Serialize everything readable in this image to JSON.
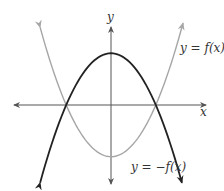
{
  "chart_data": {
    "type": "line",
    "title": "",
    "xlabel": "x",
    "ylabel": "y",
    "grid": false,
    "axis_ticks": "none",
    "series": [
      {
        "name": "y = f(x)",
        "color": "#a6a6a6",
        "shape": "upward parabola",
        "roots": [
          -2,
          2
        ],
        "vertex": [
          0,
          -2.3
        ],
        "equation_approx": "f(x) ≈ 0.58x^2 - 2.3"
      },
      {
        "name": "y = -f(x)",
        "color": "#222222",
        "shape": "downward parabola",
        "roots": [
          -2,
          2
        ],
        "vertex": [
          0,
          2.3
        ],
        "equation_approx": "-f(x) ≈ -0.58x^2 + 2.3"
      }
    ],
    "annotations": [
      "y = f(x)",
      "y = -f(x)"
    ]
  },
  "labels": {
    "x_axis": "x",
    "y_axis": "y",
    "f_label": "y = f(x)",
    "neg_f_label": "y = −f(x)"
  },
  "colors": {
    "f": "#a6a6a6",
    "neg_f": "#222222",
    "axes": "#555555"
  }
}
